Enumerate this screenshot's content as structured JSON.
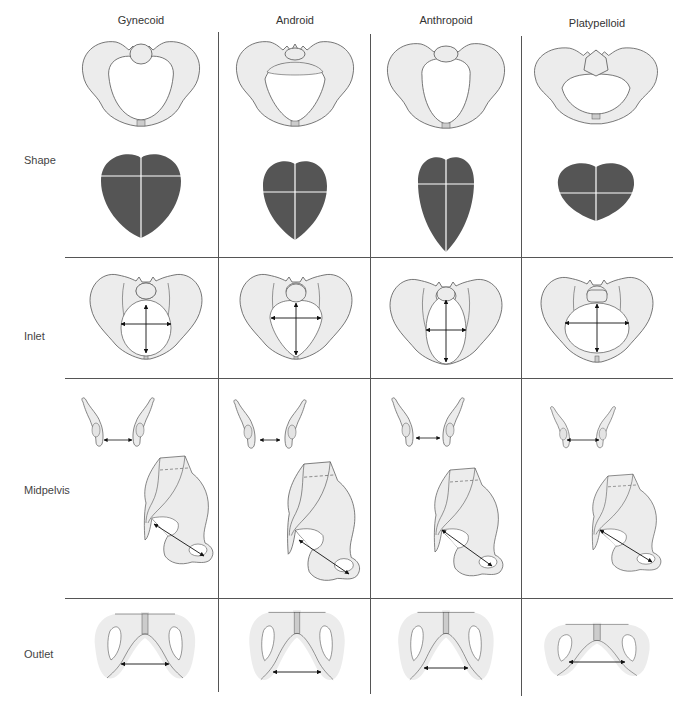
{
  "columns": [
    {
      "label": "Gynecoid",
      "center_x": 141
    },
    {
      "label": "Android",
      "center_x": 295
    },
    {
      "label": "Anthropoid",
      "center_x": 446
    },
    {
      "label": "Platypelloid",
      "center_x": 596
    }
  ],
  "rows": [
    {
      "label": "Shape",
      "y": 160
    },
    {
      "label": "Inlet",
      "y": 336
    },
    {
      "label": "Midpelvis",
      "y": 490
    },
    {
      "label": "Outlet",
      "y": 654
    }
  ],
  "colors": {
    "bone_fill": "#ececec",
    "outline": "#555555",
    "shape_fill": "#555555",
    "grid_line": "#555555",
    "arrow": "#111111"
  }
}
